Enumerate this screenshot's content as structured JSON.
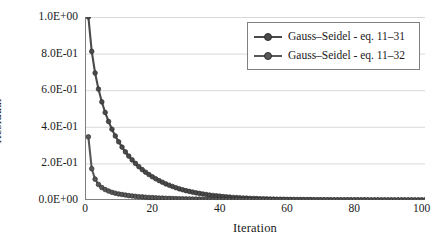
{
  "chart_data": {
    "type": "line",
    "title": "",
    "xlabel": "Iteration",
    "ylabel": "Residual",
    "xlim": [
      0,
      101
    ],
    "ylim": [
      0,
      1.0
    ],
    "grid": "horizontal",
    "legend_position": "top-right",
    "xticks": [
      {
        "value": 0,
        "label": "0"
      },
      {
        "value": 20,
        "label": "20"
      },
      {
        "value": 40,
        "label": "40"
      },
      {
        "value": 60,
        "label": "60"
      },
      {
        "value": 80,
        "label": "80"
      },
      {
        "value": 100,
        "label": "100"
      }
    ],
    "yticks": [
      {
        "value": 1.0,
        "label": "1.0E+00"
      },
      {
        "value": 0.8,
        "label": "8.0E-01"
      },
      {
        "value": 0.6,
        "label": "6.0E-01"
      },
      {
        "value": 0.4,
        "label": "4.0E-01"
      },
      {
        "value": 0.2,
        "label": "2.0E-01"
      },
      {
        "value": 0.0,
        "label": "0.0E+00"
      }
    ],
    "series": [
      {
        "name": "Gauss–Seidel - eq. 11–31",
        "color": "#4a4a4a",
        "marker": "circle",
        "x": [
          1,
          2,
          3,
          4,
          5,
          6,
          7,
          8,
          9,
          10,
          11,
          12,
          13,
          14,
          15,
          16,
          17,
          18,
          19,
          20,
          21,
          22,
          23,
          24,
          25,
          26,
          27,
          28,
          29,
          30,
          31,
          32,
          33,
          34,
          35,
          36,
          37,
          38,
          39,
          40,
          41,
          42,
          43,
          44,
          45,
          46,
          47,
          48,
          49,
          50,
          51,
          52,
          53,
          54,
          55,
          56,
          57,
          58,
          59,
          60,
          61,
          62,
          63,
          64,
          65,
          66,
          67,
          68,
          69,
          70,
          71,
          72,
          73,
          74,
          75,
          76,
          77,
          78,
          79,
          80,
          81,
          82,
          83,
          84,
          85,
          86,
          87,
          88,
          89,
          90,
          91,
          92,
          93,
          94,
          95,
          96,
          97,
          98,
          99,
          100,
          101
        ],
        "y": [
          1.0,
          0.812,
          0.694,
          0.606,
          0.536,
          0.478,
          0.429,
          0.387,
          0.35,
          0.318,
          0.289,
          0.263,
          0.24,
          0.219,
          0.2,
          0.182,
          0.166,
          0.152,
          0.139,
          0.127,
          0.116,
          0.106,
          0.097,
          0.088,
          0.081,
          0.074,
          0.067,
          0.061,
          0.056,
          0.051,
          0.047,
          0.043,
          0.039,
          0.036,
          0.033,
          0.03,
          0.027,
          0.025,
          0.023,
          0.021,
          0.019,
          0.017,
          0.016,
          0.014,
          0.013,
          0.012,
          0.011,
          0.01,
          0.009,
          0.0085,
          0.0078,
          0.0071,
          0.0065,
          0.0059,
          0.0054,
          0.0049,
          0.0045,
          0.0041,
          0.0038,
          0.0034,
          0.0031,
          0.0029,
          0.0026,
          0.0024,
          0.0022,
          0.002,
          0.0018,
          0.0017,
          0.0015,
          0.0014,
          0.0013,
          0.0012,
          0.0011,
          0.001,
          0.0009,
          0.0008,
          0.00075,
          0.00069,
          0.00063,
          0.00057,
          0.00052,
          0.00048,
          0.00044,
          0.0004,
          0.00037,
          0.00033,
          0.00031,
          0.00028,
          0.00025,
          0.00023,
          0.00021,
          0.00019,
          0.00018,
          0.00016,
          0.00015,
          0.00013,
          0.00012,
          0.00011,
          0.0001,
          9e-05,
          8e-05
        ]
      },
      {
        "name": "Gauss–Seidel - eq. 11–32",
        "color": "#585858",
        "marker": "circle",
        "x": [
          1,
          2,
          3,
          4,
          5,
          6,
          7,
          8,
          9,
          10,
          11,
          12,
          13,
          14,
          15,
          16,
          17,
          18,
          19,
          20,
          21,
          22,
          23,
          24,
          25,
          26,
          27,
          28,
          29,
          30,
          31,
          32,
          33,
          34,
          35,
          36,
          37,
          38,
          39,
          40,
          41,
          42,
          43,
          44,
          45,
          46,
          47,
          48,
          49,
          50,
          51,
          52,
          53,
          54,
          55,
          56,
          57,
          58,
          59,
          60,
          61,
          62,
          63,
          64,
          65,
          66,
          67,
          68,
          69,
          70,
          71,
          72,
          73,
          74,
          75,
          76,
          77,
          78,
          79,
          80,
          81,
          82,
          83,
          84,
          85,
          86,
          87,
          88,
          89,
          90,
          91,
          92,
          93,
          94,
          95,
          96,
          97,
          98,
          99,
          100,
          101
        ],
        "y": [
          0.345,
          0.171,
          0.114,
          0.085,
          0.068,
          0.057,
          0.049,
          0.042,
          0.037,
          0.033,
          0.03,
          0.027,
          0.024,
          0.022,
          0.02,
          0.018,
          0.017,
          0.015,
          0.014,
          0.013,
          0.012,
          0.011,
          0.0102,
          0.0095,
          0.0088,
          0.0082,
          0.0076,
          0.0071,
          0.0066,
          0.0061,
          0.0057,
          0.0053,
          0.0049,
          0.0046,
          0.0043,
          0.004,
          0.0037,
          0.0034,
          0.0032,
          0.003,
          0.0028,
          0.0026,
          0.0024,
          0.0022,
          0.0021,
          0.0019,
          0.0018,
          0.0017,
          0.0016,
          0.0015,
          0.0014,
          0.0013,
          0.0012,
          0.0011,
          0.001,
          0.00095,
          0.00089,
          0.00083,
          0.00077,
          0.00072,
          0.00067,
          0.00063,
          0.00059,
          0.00055,
          0.00051,
          0.00048,
          0.00045,
          0.00042,
          0.00039,
          0.00036,
          0.00034,
          0.00032,
          0.0003,
          0.00028,
          0.00026,
          0.00024,
          0.00022,
          0.00021,
          0.0002,
          0.00018,
          0.00017,
          0.00016,
          0.00015,
          0.00014,
          0.00013,
          0.00012,
          0.00011,
          0.0001,
          9.5e-05,
          9e-05,
          8.4e-05,
          7.8e-05,
          7.3e-05,
          6.8e-05,
          6.4e-05,
          6e-05,
          5.6e-05,
          5.2e-05,
          4.9e-05,
          4.5e-05,
          4.2e-05
        ]
      }
    ]
  },
  "style": {
    "grid_color": "#d9d9d9",
    "axis_color": "#808080",
    "text_color": "#1a1a1a",
    "legend_border_color": "#808080",
    "background": "#ffffff"
  }
}
